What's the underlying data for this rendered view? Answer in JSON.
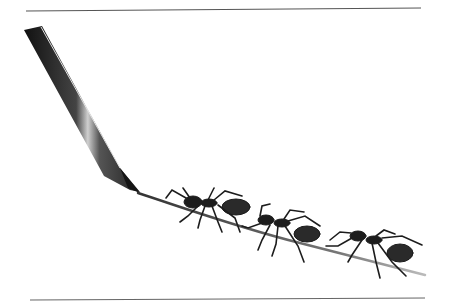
{
  "image": {
    "description": "Illustration of a pencil drawing a line on which three ants are walking, framed by thin horizontal rules above and below",
    "caption": "",
    "colors": {
      "background": "#ffffff",
      "rule": "#555555",
      "pencil_dark": "#1a1a1a",
      "pencil_mid": "#5a5a5a",
      "pencil_highlight": "#d8d8d8",
      "line": "#6a6a6a",
      "ant": "#1c1c1c"
    },
    "elements": {
      "top_rule": "horizontal rule",
      "bottom_rule": "horizontal rule",
      "pencil": "pencil",
      "drawn_line": "drawn line",
      "ants": [
        "ant 1",
        "ant 2",
        "ant 3"
      ]
    }
  }
}
